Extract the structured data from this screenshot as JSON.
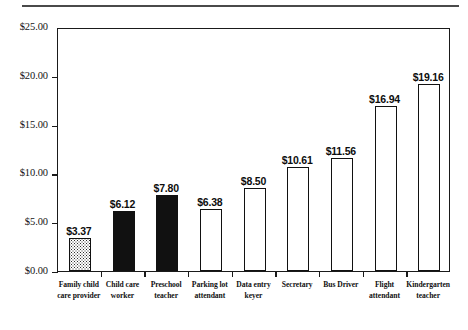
{
  "chart_data": {
    "type": "bar",
    "title": "",
    "subtitle": "",
    "xlabel": "",
    "ylabel": "",
    "ylim": [
      0,
      25
    ],
    "ytick_step": 5,
    "grid": false,
    "legend": "none",
    "value_label_prefix": "$",
    "categories": [
      "Family child care provider",
      "Child care worker",
      "Preschool teacher",
      "Parking lot attendant",
      "Data entry keyer",
      "Secretary",
      "Bus Driver",
      "Flight attendant",
      "Kindergarten teacher"
    ],
    "category_lines": [
      [
        "Family child",
        "care provider"
      ],
      [
        "Child care",
        "worker"
      ],
      [
        "Preschool",
        "teacher"
      ],
      [
        "Parking lot",
        "attendant"
      ],
      [
        "Data entry",
        "keyer"
      ],
      [
        "Secretary"
      ],
      [
        "Bus Driver"
      ],
      [
        "Flight",
        "attendant"
      ],
      [
        "Kindergarten",
        "teacher"
      ]
    ],
    "values": [
      3.37,
      6.12,
      7.8,
      6.38,
      8.5,
      10.61,
      11.56,
      16.94,
      19.16
    ],
    "value_labels": [
      "$3.37",
      "$6.12",
      "$7.80",
      "$6.38",
      "$8.50",
      "$10.61",
      "$11.56",
      "$16.94",
      "$19.16"
    ],
    "bar_fills": [
      "stipple",
      "black",
      "black",
      "white",
      "white",
      "white",
      "white",
      "white",
      "white"
    ],
    "ytick_labels": [
      "$0.00",
      "$5.00",
      "$10.00",
      "$15.00",
      "$20.00",
      "$25.00"
    ],
    "ytick_values": [
      0,
      5,
      10,
      15,
      20,
      25
    ]
  },
  "colors": {
    "bar_outline": "#111111",
    "bar_black_fill": "#111111",
    "bar_white_fill": "#ffffff",
    "bar_stipple": "#2b2b2b",
    "axis": "#1a1a1a",
    "top_rule": "#4a4a4a",
    "text": "#101010",
    "background": "#ffffff"
  }
}
